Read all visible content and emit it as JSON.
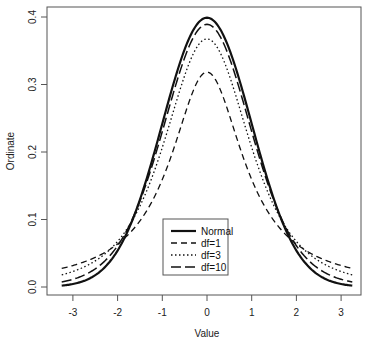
{
  "chart_data": {
    "type": "line",
    "title": "",
    "xlabel": "Value",
    "ylabel": "Ordinate",
    "xlim": [
      -3.25,
      3.25
    ],
    "ylim": [
      0,
      0.4
    ],
    "x_ticks": [
      "-3",
      "-2",
      "-1",
      "0",
      "1",
      "2",
      "3"
    ],
    "y_ticks": [
      "0.0",
      "0.1",
      "0.2",
      "0.3",
      "0.4"
    ],
    "grid": false,
    "legend_position": "bottom-center inside plot",
    "series": [
      {
        "name": "Normal",
        "style": "solid",
        "width": 2.2,
        "dist": "normal",
        "df": null,
        "peak": 0.399
      },
      {
        "name": "df=1",
        "style": "dashed",
        "width": 1.3,
        "dist": "t",
        "df": 1,
        "peak": 0.318
      },
      {
        "name": "df=3",
        "style": "dotted",
        "width": 1.3,
        "dist": "t",
        "df": 3,
        "peak": 0.368
      },
      {
        "name": "df=10",
        "style": "longdash",
        "width": 1.5,
        "dist": "t",
        "df": 10,
        "peak": 0.389
      }
    ]
  },
  "colors": {
    "line": "#111111",
    "axis": "#555555",
    "text": "#222222"
  }
}
